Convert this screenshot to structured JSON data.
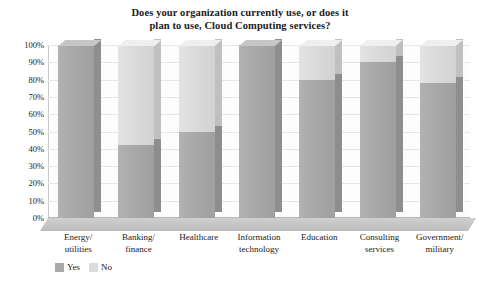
{
  "chart_data": {
    "type": "bar",
    "subtype": "stacked-column-3d",
    "title": "Does your organization currently use, or does it plan to use, Cloud Computing services?",
    "title_line1": "Does your organization currently use, or does it",
    "title_line2": "plan to use, Cloud Computing services?",
    "xlabel": "",
    "ylabel": "",
    "ylim": [
      0,
      100
    ],
    "yticks": [
      "0%",
      "10%",
      "20%",
      "30%",
      "40%",
      "50%",
      "60%",
      "70%",
      "80%",
      "90%",
      "100%"
    ],
    "ytick_values": [
      0,
      10,
      20,
      30,
      40,
      50,
      60,
      70,
      80,
      90,
      100
    ],
    "grid": true,
    "legend_position": "bottom-left",
    "categories": [
      "Energy/ utilities",
      "Banking/ finance",
      "Healthcare",
      "Information technology",
      "Education",
      "Consulting services",
      "Government/ military"
    ],
    "category_lines": [
      [
        "Energy/",
        "utilities"
      ],
      [
        "Banking/",
        "finance"
      ],
      [
        "Healthcare",
        ""
      ],
      [
        "Information",
        "technology"
      ],
      [
        "Education",
        ""
      ],
      [
        "Consulting",
        "services"
      ],
      [
        "Government/",
        "military"
      ]
    ],
    "series": [
      {
        "name": "Yes",
        "color": "#a8a8a8",
        "values": [
          100,
          42,
          50,
          100,
          80,
          90,
          78
        ]
      },
      {
        "name": "No",
        "color": "#dcdcdc",
        "values": [
          0,
          58,
          50,
          0,
          20,
          10,
          22
        ]
      }
    ]
  },
  "legend": {
    "items": [
      {
        "label": "Yes",
        "color": "#a8a8a8"
      },
      {
        "label": "No",
        "color": "#dcdcdc"
      }
    ]
  }
}
